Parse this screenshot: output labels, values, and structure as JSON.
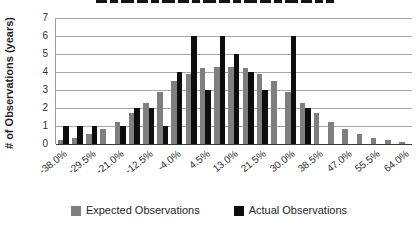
{
  "y_axis": {
    "title": "# of Observations (years)",
    "ticks": [
      "0",
      "1",
      "2",
      "3",
      "4",
      "5",
      "6",
      "7"
    ],
    "min": 0,
    "max": 7
  },
  "legend": {
    "expected_label": "Expected Observations",
    "actual_label": "Actual Observations"
  },
  "colors": {
    "expected": "#7f7f7f",
    "actual": "#0d0d0d",
    "gridline": "#a6a6a6",
    "axis_text": "#303030"
  },
  "chart_data": {
    "type": "bar",
    "categories": [
      "-38.0%",
      "-33.75%",
      "-29.5%",
      "-25.25%",
      "-21.0%",
      "-16.75%",
      "-12.5%",
      "-8.25%",
      "-4.0%",
      "0.25%",
      "4.5%",
      "8.75%",
      "13.0%",
      "17.25%",
      "21.5%",
      "25.75%",
      "30.0%",
      "34.25%",
      "38.5%",
      "42.75%",
      "47.0%",
      "51.25%",
      "55.5%",
      "59.75%",
      "64.0%"
    ],
    "x_tick_labels_shown": [
      "-38.0%",
      "-29.5%",
      "-21.0%",
      "-12.5%",
      "-4.0%",
      "4.5%",
      "13.0%",
      "21.5%",
      "30.0%",
      "38.5%",
      "47.0%",
      "55.5%",
      "64.0%"
    ],
    "x_tick_every": 2,
    "series": [
      {
        "name": "Expected Observations",
        "values": [
          0.2,
          0.35,
          0.55,
          0.85,
          1.2,
          1.7,
          2.3,
          2.9,
          3.5,
          3.9,
          4.2,
          4.3,
          4.3,
          4.2,
          3.9,
          3.5,
          2.9,
          2.3,
          1.7,
          1.2,
          0.85,
          0.55,
          0.35,
          0.2,
          0.1
        ]
      },
      {
        "name": "Actual Observations",
        "values": [
          1,
          1,
          1,
          0,
          1,
          2,
          2,
          1,
          4,
          6,
          3,
          6,
          5,
          4,
          3,
          0,
          6,
          2,
          0,
          0,
          0,
          0,
          0,
          0,
          0
        ]
      }
    ],
    "title": "",
    "xlabel": "",
    "ylabel": "# of Observations (years)",
    "ylim": [
      0,
      7
    ],
    "grid": "horizontal",
    "legend_position": "bottom"
  }
}
